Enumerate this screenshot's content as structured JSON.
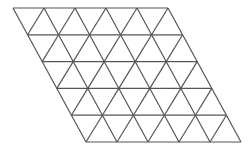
{
  "figure": {
    "name": "triangular-grid-rhombus",
    "title": "Triangular tiling of a rhombus",
    "background_color": "#ffffff",
    "line_color": "#555555",
    "line_width": 1.2,
    "canvas": {
      "width": 248,
      "height": 151
    }
  },
  "geometry": {
    "rows": 5,
    "columns": 5,
    "triangle_count": 50,
    "cell_width": 31,
    "cell_height": 26.8,
    "row_offset": 14.6,
    "origin": {
      "x": 13,
      "y": 8
    },
    "top_left": {
      "x": 13,
      "y": 8
    },
    "top_right": {
      "x": 168,
      "y": 8
    },
    "bottom_left": {
      "x": 86,
      "y": 142
    },
    "bottom_right": {
      "x": 236,
      "y": 142
    },
    "horizontal_line_y": [
      8,
      34.8,
      61.6,
      88.4,
      115.2,
      142
    ],
    "shape": "rhombus"
  },
  "lines": {
    "horizontal_label": "horizontal-grid-line",
    "down_right_label": "down-right-diagonal-line",
    "down_left_label": "down-left-diagonal-line"
  }
}
